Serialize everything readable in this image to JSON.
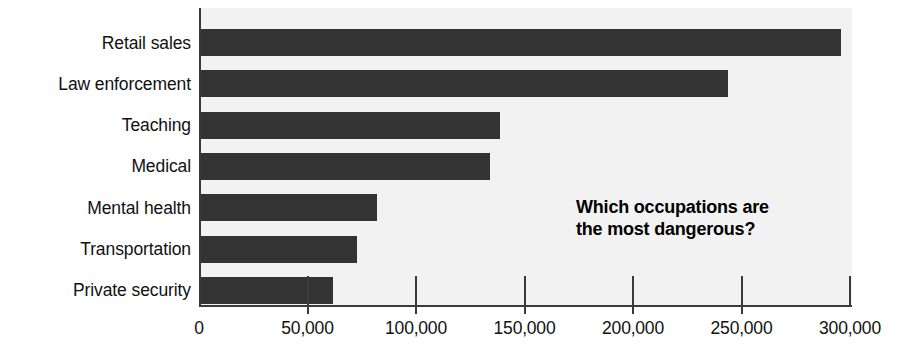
{
  "chart_data": {
    "type": "bar",
    "orientation": "horizontal",
    "title": "",
    "xlabel": "",
    "ylabel": "",
    "xlim": [
      0,
      300000
    ],
    "grid": false,
    "legend": false,
    "categories": [
      "Retail sales",
      "Law enforcement",
      "Teaching",
      "Medical",
      "Mental health",
      "Transportation",
      "Private security"
    ],
    "values": [
      295000,
      243000,
      138000,
      133000,
      81000,
      72000,
      61000
    ],
    "tick_labels": [
      "0",
      "50,000",
      "100,000",
      "150,000",
      "200,000",
      "250,000",
      "300,000"
    ],
    "tick_values": [
      0,
      50000,
      100000,
      150000,
      200000,
      250000,
      300000
    ],
    "annotation": {
      "line1": "Which occupations are",
      "line2": "the most dangerous?"
    },
    "colors": {
      "bar": "#333333",
      "plot_background": "#f2f2f2",
      "page_background": "#ffffff",
      "axis": "#3a3a3a",
      "text": "#111111"
    }
  }
}
